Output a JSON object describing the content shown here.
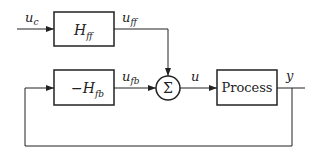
{
  "diagram": {
    "type": "block-diagram",
    "blocks": {
      "feedforward": {
        "symbol": "H",
        "subscript": "ff"
      },
      "feedback": {
        "prefix": "−",
        "symbol": "H",
        "subscript": "fb"
      },
      "summing": {
        "symbol": "Σ"
      },
      "process": {
        "label": "Process"
      }
    },
    "signals": {
      "uc": {
        "symbol": "u",
        "subscript": "c"
      },
      "uff": {
        "symbol": "u",
        "subscript": "ff"
      },
      "ufb": {
        "symbol": "u",
        "subscript": "fb"
      },
      "u": {
        "symbol": "u"
      },
      "y": {
        "symbol": "y"
      }
    },
    "colors": {
      "line": "#222222",
      "background": "#ffffff"
    }
  }
}
